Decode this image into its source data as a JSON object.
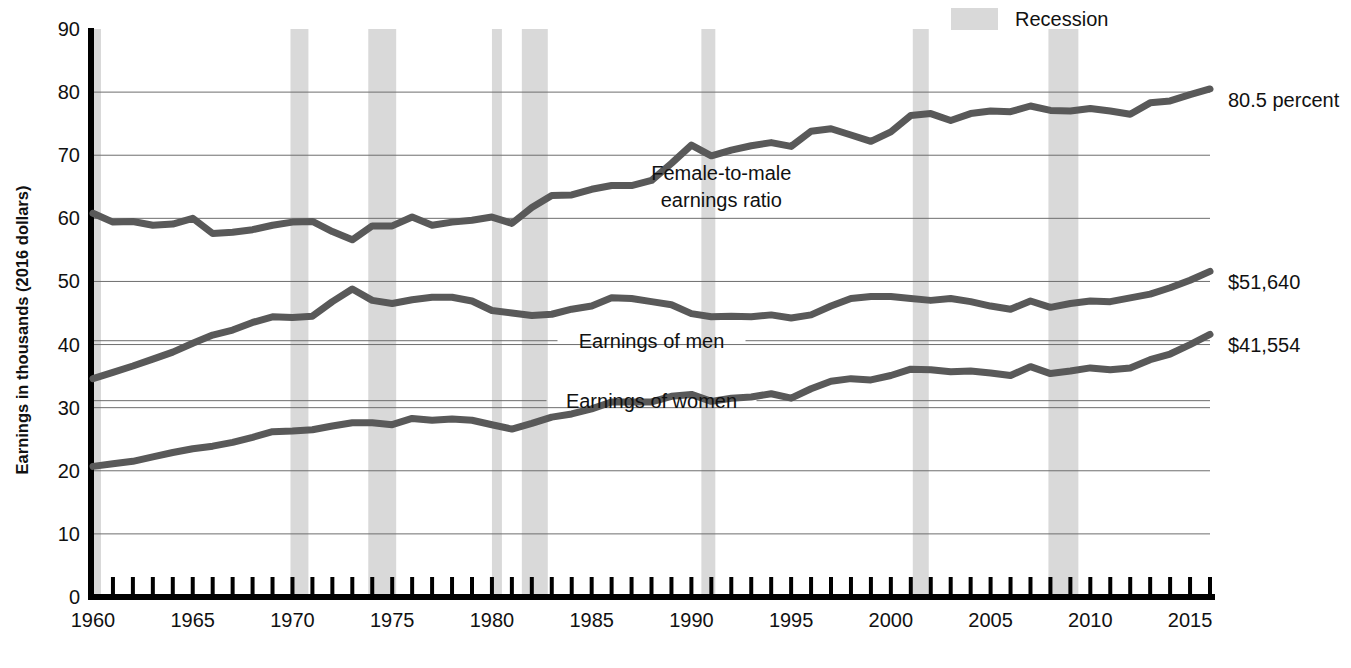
{
  "legend": {
    "position": "top-right",
    "entries": [
      {
        "label": "Recession",
        "swatch_color": "#d9d9d9",
        "type": "band"
      }
    ]
  },
  "chart_data": {
    "type": "line",
    "title": "",
    "subtitle": "",
    "xlabel": "",
    "ylabel": "Earnings in thousands (2016 dollars)",
    "xlim": [
      1960,
      2016
    ],
    "ylim": [
      0,
      90
    ],
    "grid": true,
    "grid_axis": "y",
    "y_ticks": [
      0,
      10,
      20,
      30,
      40,
      50,
      60,
      70,
      80,
      90
    ],
    "y_tick_labels": [
      "0",
      "10",
      "20",
      "30",
      "40",
      "50",
      "60",
      "70",
      "80",
      "90"
    ],
    "x_ticks": [
      1960,
      1965,
      1970,
      1975,
      1980,
      1985,
      1990,
      1995,
      2000,
      2005,
      2010,
      2015
    ],
    "x_tick_labels": [
      "1960",
      "1965",
      "1970",
      "1975",
      "1980",
      "1985",
      "1990",
      "1995",
      "2000",
      "2005",
      "2010",
      "2015"
    ],
    "x_minor_tick_interval": 1,
    "line_color": "#595959",
    "line_width": 7,
    "x": [
      1960,
      1961,
      1962,
      1963,
      1964,
      1965,
      1966,
      1967,
      1968,
      1969,
      1970,
      1971,
      1972,
      1973,
      1974,
      1975,
      1976,
      1977,
      1978,
      1979,
      1980,
      1981,
      1982,
      1983,
      1984,
      1985,
      1986,
      1987,
      1988,
      1989,
      1990,
      1991,
      1992,
      1993,
      1994,
      1995,
      1996,
      1997,
      1998,
      1999,
      2000,
      2001,
      2002,
      2003,
      2004,
      2005,
      2006,
      2007,
      2008,
      2009,
      2010,
      2011,
      2012,
      2013,
      2014,
      2015,
      2016
    ],
    "series": [
      {
        "name": "Female-to-male earnings ratio",
        "label": "Female-to-male earnings ratio",
        "units": "percent",
        "end_label": "80.5 percent",
        "values": [
          60.8,
          59.4,
          59.5,
          58.9,
          59.1,
          60.0,
          57.6,
          57.8,
          58.2,
          58.9,
          59.4,
          59.5,
          57.9,
          56.6,
          58.8,
          58.8,
          60.2,
          58.9,
          59.4,
          59.7,
          60.2,
          59.2,
          61.7,
          63.6,
          63.7,
          64.6,
          65.2,
          65.2,
          66.0,
          68.7,
          71.6,
          69.9,
          70.8,
          71.5,
          72.0,
          71.4,
          73.8,
          74.2,
          73.2,
          72.2,
          73.7,
          76.3,
          76.6,
          75.5,
          76.6,
          77.0,
          76.9,
          77.8,
          77.1,
          77.0,
          77.4,
          77.0,
          76.5,
          78.3,
          78.6,
          79.6,
          80.5
        ]
      },
      {
        "name": "Earnings of men",
        "label": "Earnings of men",
        "units": "thousands of 2016 dollars",
        "end_label": "$51,640",
        "values": [
          34.6,
          35.6,
          36.6,
          37.7,
          38.8,
          40.2,
          41.5,
          42.3,
          43.5,
          44.4,
          44.3,
          44.5,
          46.8,
          48.8,
          47.0,
          46.5,
          47.1,
          47.5,
          47.5,
          46.9,
          45.4,
          45.0,
          44.6,
          44.8,
          45.6,
          46.1,
          47.4,
          47.3,
          46.8,
          46.3,
          44.9,
          44.4,
          44.5,
          44.4,
          44.7,
          44.2,
          44.7,
          46.1,
          47.3,
          47.6,
          47.6,
          47.3,
          47.0,
          47.3,
          46.8,
          46.1,
          45.6,
          46.9,
          45.9,
          46.5,
          46.9,
          46.8,
          47.4,
          48.0,
          49.0,
          50.2,
          51.6
        ]
      },
      {
        "name": "Earnings of women",
        "label": "Earnings of women",
        "units": "thousands of 2016 dollars",
        "end_label": "$41,554",
        "values": [
          20.7,
          21.1,
          21.5,
          22.2,
          22.9,
          23.5,
          23.9,
          24.5,
          25.3,
          26.2,
          26.3,
          26.5,
          27.1,
          27.6,
          27.6,
          27.3,
          28.3,
          28.0,
          28.2,
          28.0,
          27.3,
          26.6,
          27.5,
          28.5,
          29.0,
          29.8,
          30.9,
          30.9,
          30.9,
          31.8,
          32.1,
          31.0,
          31.5,
          31.7,
          32.2,
          31.5,
          33.0,
          34.2,
          34.6,
          34.4,
          35.1,
          36.1,
          36.0,
          35.7,
          35.8,
          35.5,
          35.1,
          36.5,
          35.4,
          35.8,
          36.3,
          36.0,
          36.3,
          37.6,
          38.5,
          40.0,
          41.6
        ]
      }
    ],
    "bands": [
      {
        "label": "Recession",
        "start": 1960.0,
        "end": 1960.4
      },
      {
        "label": "Recession",
        "start": 1969.9,
        "end": 1970.8
      },
      {
        "label": "Recession",
        "start": 1973.8,
        "end": 1975.2
      },
      {
        "label": "Recession",
        "start": 1980.0,
        "end": 1980.5
      },
      {
        "label": "Recession",
        "start": 1981.5,
        "end": 1982.8
      },
      {
        "label": "Recession",
        "start": 1990.5,
        "end": 1991.2
      },
      {
        "label": "Recession",
        "start": 2001.1,
        "end": 2001.9
      },
      {
        "label": "Recession",
        "start": 2007.9,
        "end": 2009.4
      }
    ],
    "band_color": "#d9d9d9",
    "annotations": [
      {
        "text": "Female-to-male earnings ratio",
        "x": 1991.5,
        "y": 66.0,
        "lines": [
          "Female-to-male",
          "earnings ratio"
        ]
      },
      {
        "text": "Earnings of men",
        "x": 1988.0,
        "y": 39.5,
        "lines": [
          "Earnings of men"
        ]
      },
      {
        "text": "Earnings of women",
        "x": 1988.0,
        "y": 30.0,
        "lines": [
          "Earnings of women"
        ]
      }
    ]
  }
}
